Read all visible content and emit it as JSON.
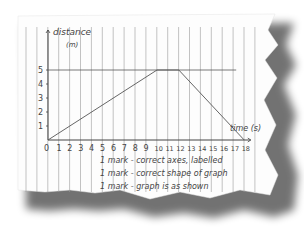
{
  "chart_data": {
    "type": "line",
    "title": "",
    "xlabel": "time (s)",
    "ylabel": "distance (m)",
    "x_ticks": [
      "0",
      "1",
      "2",
      "3",
      "4",
      "5",
      "6",
      "7",
      "8",
      "9",
      "10",
      "11",
      "12",
      "13",
      "14",
      "15",
      "16",
      "17",
      "18"
    ],
    "y_ticks": [
      "1",
      "2",
      "3",
      "4",
      "5"
    ],
    "xlim": [
      0,
      18
    ],
    "ylim": [
      0,
      5
    ],
    "grid": "vertical lines (lined paper)",
    "series": [
      {
        "name": "distance",
        "x": [
          0,
          10,
          12,
          18
        ],
        "y": [
          0,
          5,
          5,
          0
        ]
      }
    ],
    "reference_line": {
      "y": 5,
      "x_range": [
        0,
        18
      ]
    }
  },
  "axes": {
    "y_label_line1": "distance",
    "y_label_line2": "(m)",
    "x_label": "time (s)"
  },
  "notes": [
    {
      "marks": "1 mark",
      "text": "correct axes, labelled"
    },
    {
      "marks": "1 mark",
      "text": "correct shape of graph"
    },
    {
      "marks": "1 mark",
      "text": "graph is as shown"
    }
  ]
}
